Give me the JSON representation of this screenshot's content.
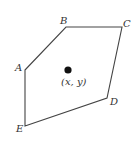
{
  "figure": {
    "type": "pentagon-with-interior-point",
    "stroke_color": "#444444",
    "vertices": [
      {
        "label": "A",
        "x": 25,
        "y": 70,
        "lx": 15,
        "ly": 71
      },
      {
        "label": "B",
        "x": 66,
        "y": 27,
        "lx": 60,
        "ly": 24
      },
      {
        "label": "C",
        "x": 122,
        "y": 27,
        "lx": 123,
        "ly": 27
      },
      {
        "label": "D",
        "x": 107,
        "y": 98,
        "lx": 110,
        "ly": 105
      },
      {
        "label": "E",
        "x": 25,
        "y": 126,
        "lx": 16,
        "ly": 132
      }
    ],
    "interior_point": {
      "x": 68,
      "y": 70,
      "radius": 3.6,
      "label": "(x, y)",
      "lx": 61,
      "ly": 85
    }
  }
}
